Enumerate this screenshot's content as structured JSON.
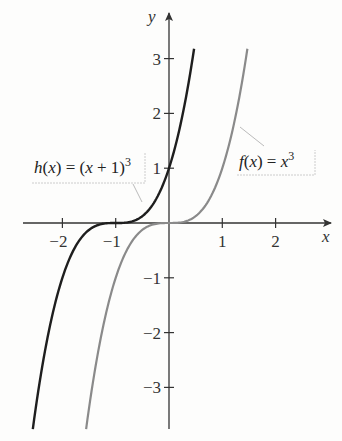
{
  "chart_data": {
    "type": "line",
    "title": "",
    "xlabel": "x",
    "ylabel": "y",
    "xlim": [
      -2.75,
      3.05
    ],
    "ylim": [
      -3.8,
      3.85
    ],
    "grid": false,
    "x_ticks": [
      -2,
      -1,
      1,
      2
    ],
    "y_ticks": [
      -3,
      -2,
      -1,
      1,
      2,
      3
    ],
    "x_tick_labels": [
      "−2",
      "−1",
      "1",
      "2"
    ],
    "y_tick_labels": [
      "−3",
      "−2",
      "−1",
      "1",
      "2",
      "3"
    ],
    "series": [
      {
        "name": "h(x) = (x + 1)^3",
        "formula": "(x+1)^3",
        "color": "#1e1e1e",
        "y_range": [
          -3.76,
          3.18
        ],
        "points": [
          [
            -2.55,
            -3.72
          ],
          [
            -2,
            -1
          ],
          [
            -1.5,
            -0.125
          ],
          [
            -1,
            0
          ],
          [
            -0.5,
            0.125
          ],
          [
            0,
            1
          ],
          [
            0.47,
            3.18
          ]
        ]
      },
      {
        "name": "f(x) = x^3",
        "formula": "x^3",
        "color": "#8a8a8a",
        "y_range": [
          -3.76,
          3.18
        ],
        "points": [
          [
            -1.55,
            -3.72
          ],
          [
            -1,
            -1
          ],
          [
            -0.5,
            -0.125
          ],
          [
            0,
            0
          ],
          [
            0.5,
            0.125
          ],
          [
            1,
            1
          ],
          [
            1.47,
            3.18
          ]
        ]
      }
    ],
    "annotations": [
      {
        "text": "h(x) = (x + 1)^3",
        "target_series": 0
      },
      {
        "text": "f(x) = x^3",
        "target_series": 1
      }
    ]
  },
  "labels": {
    "x_axis": "x",
    "y_axis": "y",
    "h_label": {
      "fn": "h",
      "arg": "x",
      "rhs_open": "(",
      "rhs_var": "x",
      "rhs_op": " + 1)",
      "exp": "3"
    },
    "f_label": {
      "fn": "f",
      "arg": "x",
      "rhs_var": "x",
      "exp": "3"
    }
  }
}
